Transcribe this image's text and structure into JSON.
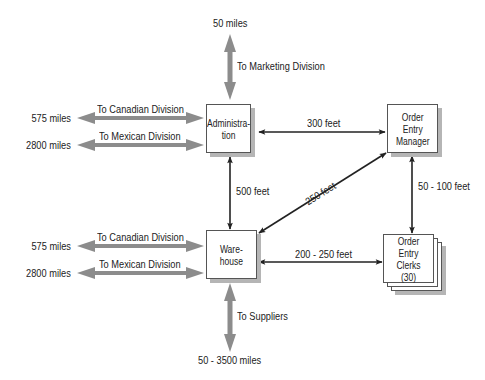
{
  "nodes": {
    "administration": {
      "label_line1": "Administra-",
      "label_line2": "tion"
    },
    "order_entry_manager": {
      "label_line1": "Order",
      "label_line2": "Entry",
      "label_line3": "Manager"
    },
    "warehouse": {
      "label_line1": "Ware-",
      "label_line2": "house"
    },
    "order_entry_clerks": {
      "label_line1": "Order Entry",
      "label_line2": "Clerks",
      "label_line3": "(30)"
    }
  },
  "external_links": {
    "admin_marketing": {
      "destination": "To Marketing Division",
      "distance": "50 miles"
    },
    "admin_canadian": {
      "destination": "To Canadian Division",
      "distance": "575 miles"
    },
    "admin_mexican": {
      "destination": "To Mexican Division",
      "distance": "2800 miles"
    },
    "warehouse_canadian": {
      "destination": "To Canadian Division",
      "distance": "575 miles"
    },
    "warehouse_mexican": {
      "destination": "To Mexican Division",
      "distance": "2800 miles"
    },
    "warehouse_suppliers": {
      "destination": "To Suppliers",
      "distance": "50 - 3500 miles"
    }
  },
  "internal_links": {
    "admin_manager": {
      "distance": "300 feet"
    },
    "admin_warehouse": {
      "distance": "500 feet"
    },
    "warehouse_manager": {
      "distance": "250 feet"
    },
    "manager_clerks": {
      "distance": "50 - 100 feet"
    },
    "warehouse_clerks": {
      "distance": "200 - 250 feet"
    }
  },
  "colors": {
    "external_arrow": "#8c8c8c",
    "internal_arrow": "#222222",
    "box_border": "#555555",
    "box_shadow": "#b5b5b5"
  }
}
